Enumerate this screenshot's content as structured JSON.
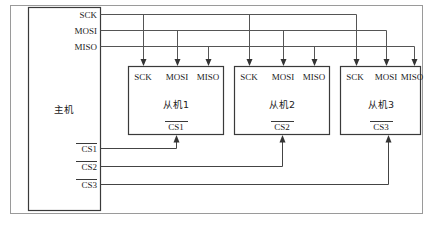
{
  "diagram": {
    "master": {
      "label": "主机",
      "ports": {
        "sck": "SCK",
        "mosi": "MOSI",
        "miso": "MISO",
        "cs1": "CS1",
        "cs2": "CS2",
        "cs3": "CS3"
      }
    },
    "slaves": [
      {
        "label": "从机1",
        "ports": {
          "sck": "SCK",
          "mosi": "MOSI",
          "miso": "MISO"
        },
        "cs": "CS1"
      },
      {
        "label": "从机2",
        "ports": {
          "sck": "SCK",
          "mosi": "MOSI",
          "miso": "MISO"
        },
        "cs": "CS2"
      },
      {
        "label": "从机3",
        "ports": {
          "sck": "SCK",
          "mosi": "MOSI",
          "miso": "MISO"
        },
        "cs": "CS3"
      }
    ],
    "colors": {
      "frame": "#9a9a9a",
      "box_stroke": "#3a3a3a",
      "wire": "#555555",
      "text": "#222222",
      "background": "#ffffff"
    }
  }
}
